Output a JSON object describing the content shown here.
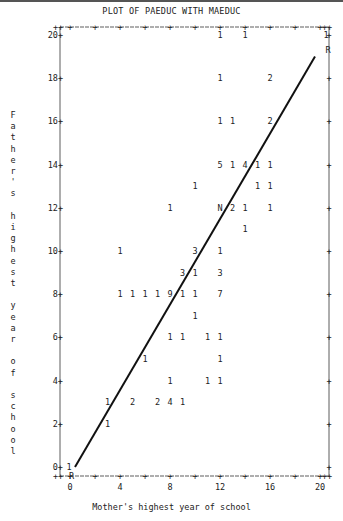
{
  "title": "PLOT OF PAEDUC WITH MAEDUC",
  "xlabel": "Mother's highest year of school",
  "ylabel": "Father's highest year of school",
  "chart_data": {
    "type": "scatter",
    "title": "PLOT OF PAEDUC WITH MAEDUC",
    "xlabel": "Mother's highest year of school",
    "ylabel": "Father's highest year of school",
    "xlim": [
      0,
      20
    ],
    "ylim": [
      0,
      20
    ],
    "x_ticks": [
      0,
      4,
      8,
      12,
      16,
      20
    ],
    "y_ticks": [
      0,
      2,
      4,
      6,
      8,
      10,
      12,
      14,
      16,
      18,
      20
    ],
    "grid": false,
    "note": "Symbols denote counts of cases at each point; N = overlap with regression line marker; R = regression line endpoints",
    "points": [
      {
        "x": 12,
        "y": 20,
        "label": "1"
      },
      {
        "x": 14,
        "y": 20,
        "label": "1"
      },
      {
        "x": 20,
        "y": 20,
        "label": "1"
      },
      {
        "x": 12,
        "y": 18,
        "label": "1"
      },
      {
        "x": 16,
        "y": 18,
        "label": "2"
      },
      {
        "x": 12,
        "y": 16,
        "label": "1"
      },
      {
        "x": 13,
        "y": 16,
        "label": "1"
      },
      {
        "x": 16,
        "y": 16,
        "label": "2"
      },
      {
        "x": 12,
        "y": 14,
        "label": "5"
      },
      {
        "x": 13,
        "y": 14,
        "label": "1"
      },
      {
        "x": 14,
        "y": 14,
        "label": "4"
      },
      {
        "x": 15,
        "y": 14,
        "label": "1"
      },
      {
        "x": 16,
        "y": 14,
        "label": "1"
      },
      {
        "x": 10,
        "y": 13,
        "label": "1"
      },
      {
        "x": 15,
        "y": 13,
        "label": "1"
      },
      {
        "x": 16,
        "y": 13,
        "label": "1"
      },
      {
        "x": 8,
        "y": 12,
        "label": "1"
      },
      {
        "x": 12,
        "y": 12,
        "label": "N"
      },
      {
        "x": 13,
        "y": 12,
        "label": "2"
      },
      {
        "x": 14,
        "y": 12,
        "label": "1"
      },
      {
        "x": 16,
        "y": 12,
        "label": "1"
      },
      {
        "x": 14,
        "y": 11,
        "label": "1"
      },
      {
        "x": 4,
        "y": 10,
        "label": "1"
      },
      {
        "x": 10,
        "y": 10,
        "label": "3"
      },
      {
        "x": 12,
        "y": 10,
        "label": "1"
      },
      {
        "x": 9,
        "y": 9,
        "label": "3"
      },
      {
        "x": 10,
        "y": 9,
        "label": "1"
      },
      {
        "x": 12,
        "y": 9,
        "label": "3"
      },
      {
        "x": 4,
        "y": 8,
        "label": "1"
      },
      {
        "x": 5,
        "y": 8,
        "label": "1"
      },
      {
        "x": 6,
        "y": 8,
        "label": "1"
      },
      {
        "x": 7,
        "y": 8,
        "label": "1"
      },
      {
        "x": 8,
        "y": 8,
        "label": "9"
      },
      {
        "x": 9,
        "y": 8,
        "label": "1"
      },
      {
        "x": 10,
        "y": 8,
        "label": "1"
      },
      {
        "x": 12,
        "y": 8,
        "label": "7"
      },
      {
        "x": 10,
        "y": 7,
        "label": "1"
      },
      {
        "x": 8,
        "y": 6,
        "label": "1"
      },
      {
        "x": 9,
        "y": 6,
        "label": "1"
      },
      {
        "x": 11,
        "y": 6,
        "label": "1"
      },
      {
        "x": 12,
        "y": 6,
        "label": "1"
      },
      {
        "x": 6,
        "y": 5,
        "label": "1"
      },
      {
        "x": 12,
        "y": 5,
        "label": "1"
      },
      {
        "x": 8,
        "y": 4,
        "label": "1"
      },
      {
        "x": 11,
        "y": 4,
        "label": "1"
      },
      {
        "x": 12,
        "y": 4,
        "label": "1"
      },
      {
        "x": 3,
        "y": 3,
        "label": "1"
      },
      {
        "x": 5,
        "y": 3,
        "label": "2"
      },
      {
        "x": 7,
        "y": 3,
        "label": "2"
      },
      {
        "x": 8,
        "y": 3,
        "label": "4"
      },
      {
        "x": 9,
        "y": 3,
        "label": "1"
      },
      {
        "x": 3,
        "y": 2,
        "label": "1"
      },
      {
        "x": 0,
        "y": 0,
        "label": "1"
      }
    ],
    "regression_line": {
      "x0": 0.4,
      "y0": 0,
      "x1": 19.6,
      "y1": 19,
      "end_markers": [
        "R",
        "R"
      ]
    }
  }
}
